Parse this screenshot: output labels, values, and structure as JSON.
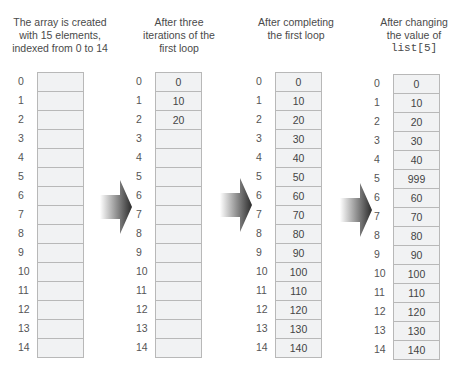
{
  "diagram": {
    "steps": [
      {
        "caption_lines": [
          "The array is created",
          "with 15 elements,",
          "indexed from 0 to 14"
        ],
        "caption_code": "",
        "values": [
          "",
          "",
          "",
          "",
          "",
          "",
          "",
          "",
          "",
          "",
          "",
          "",
          "",
          "",
          ""
        ]
      },
      {
        "caption_lines": [
          "After three",
          "iterations of the",
          "first loop"
        ],
        "caption_code": "",
        "values": [
          "0",
          "10",
          "20",
          "",
          "",
          "",
          "",
          "",
          "",
          "",
          "",
          "",
          "",
          "",
          ""
        ]
      },
      {
        "caption_lines": [
          "After completing",
          "the first loop"
        ],
        "caption_code": "",
        "values": [
          "0",
          "10",
          "20",
          "30",
          "40",
          "50",
          "60",
          "70",
          "80",
          "90",
          "100",
          "110",
          "120",
          "130",
          "140"
        ]
      },
      {
        "caption_lines": [
          "After changing",
          "the value of"
        ],
        "caption_code": "list[5]",
        "values": [
          "0",
          "10",
          "20",
          "30",
          "40",
          "999",
          "60",
          "70",
          "80",
          "90",
          "100",
          "110",
          "120",
          "130",
          "140"
        ]
      }
    ],
    "indices": [
      "0",
      "1",
      "2",
      "3",
      "4",
      "5",
      "6",
      "7",
      "8",
      "9",
      "10",
      "11",
      "12",
      "13",
      "14"
    ],
    "arrows": [
      {
        "direction": "right"
      },
      {
        "direction": "right"
      },
      {
        "direction": "right"
      }
    ],
    "colors": {
      "cell_fill": "#f1f2f3",
      "cell_border": "#b8b8b8",
      "arrow_dark": "#2b2b2b"
    }
  }
}
